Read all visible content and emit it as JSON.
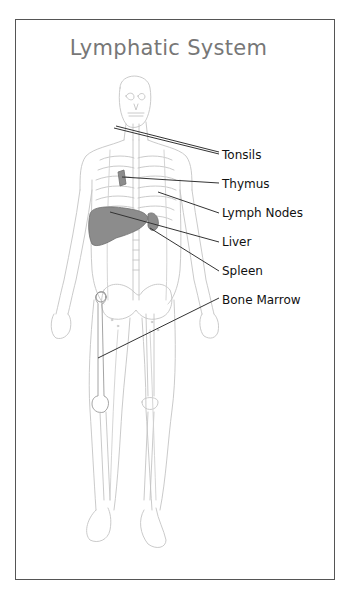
{
  "diagram": {
    "title": "Lymphatic System",
    "labels": [
      {
        "id": "tonsils",
        "text": "Tonsils",
        "x": 222,
        "y": 148
      },
      {
        "id": "thymus",
        "text": "Thymus",
        "x": 222,
        "y": 178
      },
      {
        "id": "lymph_nodes",
        "text": "Lymph Nodes",
        "x": 222,
        "y": 207
      },
      {
        "id": "liver",
        "text": "Liver",
        "x": 222,
        "y": 236
      },
      {
        "id": "spleen",
        "text": "Spleen",
        "x": 222,
        "y": 265
      },
      {
        "id": "bone_marrow",
        "text": "Bone Marrow",
        "x": 222,
        "y": 294
      }
    ],
    "colors": {
      "frame": "#555555",
      "title": "#777777",
      "label": "#111111",
      "outline": "#bdbdbd",
      "organ_fill": "#8a8a8a",
      "leader": "#333333"
    }
  }
}
